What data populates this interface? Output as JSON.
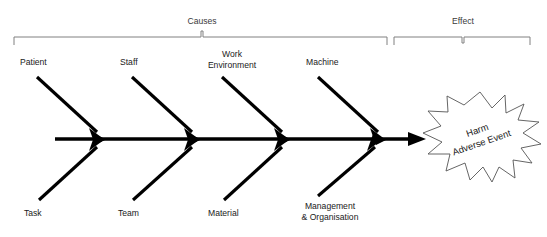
{
  "diagram": {
    "type": "fishbone-ishikawa-diagram",
    "title": "",
    "brackets": [
      {
        "id": "causes",
        "label": "Causes",
        "x_start": 14,
        "x_end": 389,
        "label_x": 202
      },
      {
        "id": "effect",
        "label": "Effect",
        "x_start": 396,
        "x_end": 530,
        "label_x": 463
      }
    ],
    "spine": {
      "x_start": 55,
      "x_end": 425,
      "y": 139,
      "arrow": "right"
    },
    "top_bones": [
      {
        "id": "patient",
        "label": "Patient",
        "label_lines": [
          "Patient"
        ],
        "label_x": 20,
        "label_y": 62,
        "anchor": "start",
        "tail_x": 37,
        "tail_y": 77,
        "head_x": 104,
        "head_y": 139
      },
      {
        "id": "staff",
        "label": "Staff",
        "label_lines": [
          "Staff"
        ],
        "label_x": 120,
        "label_y": 62,
        "anchor": "start",
        "tail_x": 132,
        "tail_y": 77,
        "head_x": 199,
        "head_y": 139
      },
      {
        "id": "work-environment",
        "label": "Work Environment",
        "label_lines": [
          "Work",
          "Environment"
        ],
        "label_x": 232,
        "label_y": 57,
        "anchor": "middle",
        "tail_x": 225,
        "tail_y": 77,
        "head_x": 288,
        "head_y": 139
      },
      {
        "id": "machine",
        "label": "Machine",
        "label_lines": [
          "Machine"
        ],
        "label_x": 306,
        "label_y": 62,
        "anchor": "start",
        "tail_x": 318,
        "tail_y": 77,
        "head_x": 385,
        "head_y": 139
      }
    ],
    "bottom_bones": [
      {
        "id": "task",
        "label": "Task",
        "label_lines": [
          "Task"
        ],
        "label_x": 24,
        "label_y": 215,
        "anchor": "start",
        "tail_x": 39,
        "tail_y": 200,
        "head_x": 104,
        "head_y": 140
      },
      {
        "id": "team",
        "label": "Team",
        "label_lines": [
          "Team"
        ],
        "label_x": 118,
        "label_y": 215,
        "anchor": "start",
        "tail_x": 133,
        "tail_y": 200,
        "head_x": 199,
        "head_y": 140
      },
      {
        "id": "material",
        "label": "Material",
        "label_lines": [
          "Material"
        ],
        "label_x": 208,
        "label_y": 215,
        "anchor": "start",
        "tail_x": 224,
        "tail_y": 200,
        "head_x": 289,
        "head_y": 140
      },
      {
        "id": "management-organisation",
        "label": "Management & Organisation",
        "label_lines": [
          "Management",
          "& Organisation"
        ],
        "label_x": 330,
        "label_y": 208,
        "anchor": "middle",
        "tail_x": 318,
        "tail_y": 196,
        "head_x": 382,
        "head_y": 140
      }
    ],
    "effect_burst": {
      "id": "harm-adverse-event",
      "lines": [
        "Harm",
        "Adverse Event"
      ],
      "center_x": 480,
      "center_y": 138,
      "rotation_deg": -19
    }
  },
  "colors": {
    "bone": "#000000",
    "bracket": "#808080",
    "text": "#1a1a1a",
    "burst_stroke": "#555555",
    "background": "#ffffff"
  }
}
